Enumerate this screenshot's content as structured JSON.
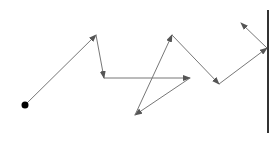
{
  "diagram": {
    "colors": {
      "path": "#777777",
      "wall": "#333333",
      "start": "#000000",
      "background": "#ffffff"
    },
    "start_point": {
      "x": 25,
      "y": 105,
      "r": 3.5
    },
    "wall": {
      "x": 268,
      "y1": 10,
      "y2": 133
    },
    "path_points": [
      {
        "x": 25,
        "y": 105
      },
      {
        "x": 96,
        "y": 35
      },
      {
        "x": 104,
        "y": 78
      },
      {
        "x": 190,
        "y": 78
      },
      {
        "x": 135,
        "y": 115
      },
      {
        "x": 172,
        "y": 35
      },
      {
        "x": 219,
        "y": 84
      },
      {
        "x": 267,
        "y": 48
      },
      {
        "x": 241,
        "y": 23
      }
    ]
  }
}
